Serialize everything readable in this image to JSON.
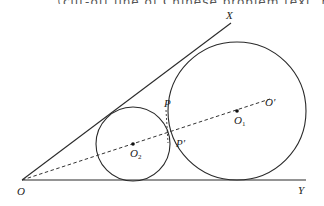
{
  "top_text": {
    "content": "……（cut-off line of Chinese problem text, not legible）……"
  },
  "figure": {
    "points": {
      "O": {
        "label": "O",
        "x": 22,
        "y": 180
      },
      "X": {
        "label": "X",
        "x": 230,
        "y": 25
      },
      "Y": {
        "label": "Y",
        "x": 305,
        "y": 180
      },
      "O1": {
        "label": "O",
        "sub": "1",
        "x": 237,
        "y": 111
      },
      "O2": {
        "label": "O",
        "sub": "2",
        "x": 133,
        "y": 144
      },
      "O_prime": {
        "label": "O′",
        "x": 268,
        "y": 102
      },
      "P": {
        "label": "P",
        "x": 166,
        "y": 108
      },
      "P_prime": {
        "label": "P′",
        "x": 168,
        "y": 144
      }
    },
    "circles": [
      {
        "name": "circle-O1",
        "cx": 237,
        "cy": 111,
        "r": 69
      },
      {
        "name": "circle-O2",
        "cx": 133,
        "cy": 144,
        "r": 37
      }
    ],
    "line_color": "#2a2a2a",
    "dash_color": "#333333"
  }
}
